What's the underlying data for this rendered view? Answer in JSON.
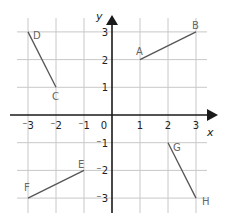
{
  "diagram": {
    "type": "coordinate-grid",
    "axes": {
      "x_label": "x",
      "y_label": "y",
      "x_ticks": [
        {
          "value": -3,
          "label": "⁻3"
        },
        {
          "value": -2,
          "label": "⁻2"
        },
        {
          "value": -1,
          "label": "⁻1"
        },
        {
          "value": 0,
          "label": "0"
        },
        {
          "value": 1,
          "label": "1"
        },
        {
          "value": 2,
          "label": "2"
        },
        {
          "value": 3,
          "label": "3"
        }
      ],
      "y_ticks": [
        {
          "value": 3,
          "label": "3"
        },
        {
          "value": 2,
          "label": "2"
        },
        {
          "value": 1,
          "label": "1"
        },
        {
          "value": -1,
          "label": "⁻1"
        },
        {
          "value": -2,
          "label": "⁻2"
        },
        {
          "value": -3,
          "label": "⁻3"
        }
      ],
      "range": {
        "x": [
          -3,
          3
        ],
        "y": [
          -3,
          3
        ]
      }
    },
    "segments": [
      {
        "name": "AB",
        "from": {
          "label": "A",
          "x": 1,
          "y": 2
        },
        "to": {
          "label": "B",
          "x": 3,
          "y": 3
        }
      },
      {
        "name": "CD",
        "from": {
          "label": "C",
          "x": -2,
          "y": 1
        },
        "to": {
          "label": "D",
          "x": -3,
          "y": 3
        }
      },
      {
        "name": "EF",
        "from": {
          "label": "E",
          "x": -1,
          "y": -2
        },
        "to": {
          "label": "F",
          "x": -3,
          "y": -3
        }
      },
      {
        "name": "GH",
        "from": {
          "label": "G",
          "x": 2,
          "y": -1
        },
        "to": {
          "label": "H",
          "x": 3,
          "y": -3
        }
      }
    ],
    "point_labels": [
      {
        "label": "A",
        "x": 1,
        "y": 2,
        "dx": -4,
        "dy": -8
      },
      {
        "label": "B",
        "x": 3,
        "y": 3,
        "dx": -4,
        "dy": -6
      },
      {
        "label": "C",
        "x": -2,
        "y": 1,
        "dx": -4,
        "dy": 10
      },
      {
        "label": "D",
        "x": -3,
        "y": 3,
        "dx": 5,
        "dy": 4
      },
      {
        "label": "E",
        "x": -1,
        "y": -2,
        "dx": -6,
        "dy": -5
      },
      {
        "label": "F",
        "x": -3,
        "y": -3,
        "dx": -4,
        "dy": -10
      },
      {
        "label": "G",
        "x": 2,
        "y": -1,
        "dx": 5,
        "dy": 5
      },
      {
        "label": "H",
        "x": 3,
        "y": -3,
        "dx": 6,
        "dy": 4
      }
    ],
    "colors": {
      "grid": "#c8c8c8",
      "axis": "#1a1a1a",
      "segment": "#555555",
      "label": "#666666",
      "tick_label": "#222222"
    }
  }
}
